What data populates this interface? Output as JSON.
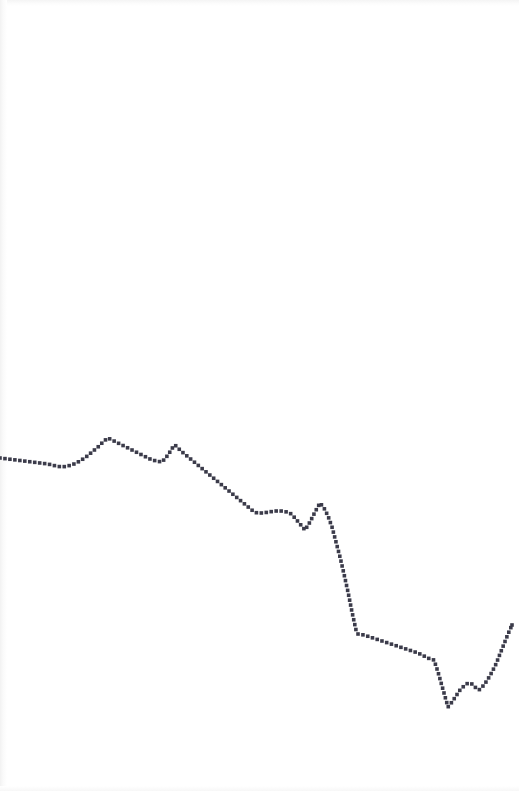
{
  "figure": {
    "width": 519,
    "height": 791,
    "background_color": "#ffffff",
    "title": "",
    "subtitle": "",
    "caption": ""
  },
  "style": {
    "marker_color": "#3b3b4a",
    "marker_shape": "square-dot",
    "marker_size_px": 1.8,
    "dot_spacing_px": 5,
    "line_style": "dotted",
    "line_visible": false,
    "grid": "off",
    "axes_visible": false,
    "axis_labels_visible": false,
    "tick_labels_visible": false,
    "legend_visible": false,
    "edge_shade_color": "#f2f2f2"
  },
  "chart_data": {
    "type": "line",
    "title": "",
    "xlabel": "",
    "ylabel": "",
    "grid": false,
    "legend": "none",
    "axis_visible": false,
    "xlim": [
      0,
      519
    ],
    "ylim": [
      791,
      0
    ],
    "y_axis_inverted": true,
    "coordinate_space": "pixel",
    "series": [
      {
        "name": "series-1",
        "marker": "dot",
        "color": "#3b3b4a",
        "points": [
          [
            0,
            458
          ],
          [
            8,
            459
          ],
          [
            16,
            460
          ],
          [
            24,
            461
          ],
          [
            32,
            462
          ],
          [
            40,
            463
          ],
          [
            48,
            464
          ],
          [
            56,
            466
          ],
          [
            62,
            467
          ],
          [
            68,
            466
          ],
          [
            74,
            464
          ],
          [
            80,
            461
          ],
          [
            86,
            457
          ],
          [
            92,
            452
          ],
          [
            98,
            447
          ],
          [
            104,
            441
          ],
          [
            108,
            438
          ],
          [
            114,
            441
          ],
          [
            120,
            444
          ],
          [
            126,
            447
          ],
          [
            132,
            450
          ],
          [
            138,
            453
          ],
          [
            144,
            456
          ],
          [
            150,
            459
          ],
          [
            156,
            461
          ],
          [
            162,
            462
          ],
          [
            168,
            455
          ],
          [
            173,
            447
          ],
          [
            175,
            445
          ],
          [
            181,
            451
          ],
          [
            187,
            456
          ],
          [
            193,
            461
          ],
          [
            199,
            466
          ],
          [
            205,
            471
          ],
          [
            211,
            476
          ],
          [
            217,
            481
          ],
          [
            223,
            486
          ],
          [
            229,
            491
          ],
          [
            235,
            496
          ],
          [
            241,
            501
          ],
          [
            247,
            506
          ],
          [
            253,
            511
          ],
          [
            257,
            513
          ],
          [
            263,
            513
          ],
          [
            269,
            512
          ],
          [
            275,
            511
          ],
          [
            281,
            511
          ],
          [
            287,
            512
          ],
          [
            290,
            513
          ],
          [
            295,
            518
          ],
          [
            300,
            524
          ],
          [
            305,
            530
          ],
          [
            310,
            522
          ],
          [
            315,
            512
          ],
          [
            320,
            503
          ],
          [
            324,
            508
          ],
          [
            328,
            516
          ],
          [
            332,
            527
          ],
          [
            336,
            542
          ],
          [
            340,
            557
          ],
          [
            344,
            574
          ],
          [
            348,
            592
          ],
          [
            352,
            612
          ],
          [
            356,
            630
          ],
          [
            358,
            634
          ],
          [
            364,
            635
          ],
          [
            370,
            637
          ],
          [
            376,
            639
          ],
          [
            382,
            641
          ],
          [
            388,
            643
          ],
          [
            394,
            645
          ],
          [
            400,
            647
          ],
          [
            406,
            649
          ],
          [
            412,
            651
          ],
          [
            418,
            653
          ],
          [
            424,
            656
          ],
          [
            430,
            659
          ],
          [
            434,
            660
          ],
          [
            438,
            672
          ],
          [
            442,
            686
          ],
          [
            446,
            700
          ],
          [
            448,
            707
          ],
          [
            452,
            702
          ],
          [
            456,
            696
          ],
          [
            460,
            690
          ],
          [
            464,
            686
          ],
          [
            468,
            683
          ],
          [
            472,
            684
          ],
          [
            476,
            688
          ],
          [
            479,
            690
          ],
          [
            484,
            685
          ],
          [
            488,
            679
          ],
          [
            492,
            672
          ],
          [
            496,
            664
          ],
          [
            500,
            654
          ],
          [
            504,
            644
          ],
          [
            508,
            634
          ],
          [
            512,
            625
          ]
        ]
      }
    ]
  }
}
